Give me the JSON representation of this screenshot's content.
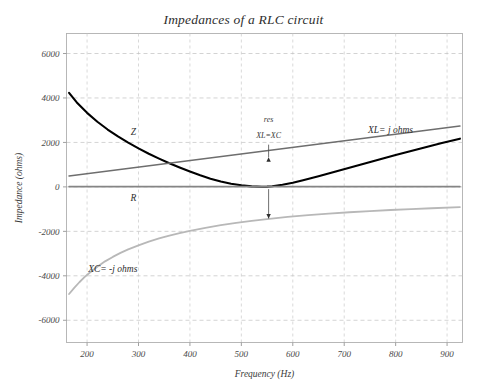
{
  "chart_data": {
    "type": "line",
    "title": "Impedances of a RLC circuit",
    "xlabel": "Frequency (Hz)",
    "ylabel": "Impedance (ohms)",
    "xlim": [
      160,
      930
    ],
    "ylim": [
      -7000,
      6900
    ],
    "xticks": [
      200,
      300,
      400,
      500,
      600,
      700,
      800,
      900
    ],
    "yticks": [
      6000,
      4000,
      2000,
      0,
      -2000,
      -4000,
      -6000
    ],
    "xtick_labels": [
      "200",
      "300",
      "400",
      "500",
      "600",
      "700",
      "800",
      "900"
    ],
    "ytick_labels": [
      "6000",
      "4000",
      "2000",
      "0",
      "-2000",
      "-4000",
      "-6000"
    ],
    "grid": true,
    "grid_style": "dashed",
    "legend": "inline-labels",
    "series": [
      {
        "name": "Z",
        "label": "Z",
        "color": "#000000",
        "width": 2.1,
        "label_x": 290,
        "label_y": 2350,
        "points": [
          [
            165,
            4230
          ],
          [
            180,
            3800
          ],
          [
            200,
            3330
          ],
          [
            220,
            2930
          ],
          [
            240,
            2580
          ],
          [
            260,
            2270
          ],
          [
            280,
            1990
          ],
          [
            300,
            1730
          ],
          [
            320,
            1490
          ],
          [
            340,
            1270
          ],
          [
            360,
            1060
          ],
          [
            380,
            870
          ],
          [
            400,
            690
          ],
          [
            420,
            520
          ],
          [
            440,
            370
          ],
          [
            460,
            240
          ],
          [
            480,
            140
          ],
          [
            500,
            70
          ],
          [
            520,
            25
          ],
          [
            540,
            8
          ],
          [
            550,
            10
          ],
          [
            560,
            30
          ],
          [
            580,
            95
          ],
          [
            600,
            190
          ],
          [
            620,
            300
          ],
          [
            650,
            480
          ],
          [
            680,
            670
          ],
          [
            710,
            860
          ],
          [
            740,
            1050
          ],
          [
            770,
            1240
          ],
          [
            800,
            1430
          ],
          [
            830,
            1610
          ],
          [
            860,
            1790
          ],
          [
            890,
            1970
          ],
          [
            925,
            2170
          ]
        ]
      },
      {
        "name": "XL",
        "label": "XL= j ohms",
        "color": "#6e6e6e",
        "width": 1.6,
        "label_x": 790,
        "label_y": 2420,
        "points": [
          [
            165,
            490
          ],
          [
            925,
            2740
          ]
        ]
      },
      {
        "name": "R",
        "label": "R",
        "color": "#858585",
        "width": 1.6,
        "label_x": 290,
        "label_y": -620,
        "points": [
          [
            165,
            10
          ],
          [
            925,
            10
          ]
        ]
      },
      {
        "name": "XC",
        "label": "XC= -j ohms",
        "color": "#b8b8b8",
        "width": 1.8,
        "label_x": 250,
        "label_y": -3840,
        "points": [
          [
            165,
            -4820
          ],
          [
            175,
            -4540
          ],
          [
            185,
            -4290
          ],
          [
            195,
            -4060
          ],
          [
            205,
            -3860
          ],
          [
            220,
            -3590
          ],
          [
            235,
            -3350
          ],
          [
            250,
            -3150
          ],
          [
            265,
            -2970
          ],
          [
            280,
            -2810
          ],
          [
            300,
            -2630
          ],
          [
            320,
            -2460
          ],
          [
            340,
            -2320
          ],
          [
            360,
            -2190
          ],
          [
            380,
            -2080
          ],
          [
            400,
            -1980
          ],
          [
            430,
            -1840
          ],
          [
            460,
            -1720
          ],
          [
            490,
            -1620
          ],
          [
            520,
            -1530
          ],
          [
            550,
            -1450
          ],
          [
            590,
            -1350
          ],
          [
            630,
            -1270
          ],
          [
            670,
            -1200
          ],
          [
            710,
            -1140
          ],
          [
            750,
            -1090
          ],
          [
            790,
            -1040
          ],
          [
            830,
            -1000
          ],
          [
            870,
            -960
          ],
          [
            925,
            -910
          ]
        ]
      }
    ],
    "annotations": [
      {
        "name": "resonance",
        "line1": "res",
        "line2": "XL=XC",
        "text_x": 553,
        "text_y1": 2900,
        "text_y2": 2180,
        "arrow_x": 553,
        "arrow_up_from": 1900,
        "arrow_up_to": 1330,
        "arrow_down_from": -100,
        "arrow_down_to": -1420
      }
    ]
  }
}
